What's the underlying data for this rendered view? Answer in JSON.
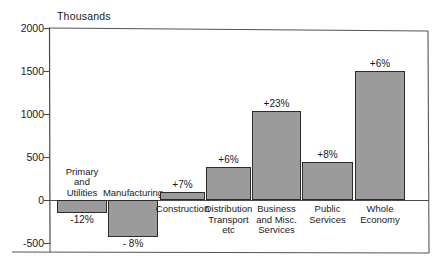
{
  "chart_data": {
    "type": "bar",
    "title": "",
    "unit_label": "Thousands",
    "xlabel": "",
    "ylabel": "Thousands",
    "ylim": [
      -500,
      2000
    ],
    "ytick_labels": [
      "2000",
      "1500",
      "1000",
      "500",
      "0",
      "-500"
    ],
    "ytick_values": [
      2000,
      1500,
      1000,
      500,
      0,
      -500
    ],
    "grid": false,
    "legend": "none",
    "zero_line": 0,
    "categories": [
      "Primary and Utilities",
      "Manufacturing",
      "Construction",
      "Distribution Transport etc",
      "Business and Misc. Services",
      "Public Services",
      "Whole Economy"
    ],
    "category_label_lines": [
      [
        "Primary",
        "and",
        "Utilities"
      ],
      [
        "Manufacturing"
      ],
      [
        "Construction"
      ],
      [
        "Distribution",
        "Transport",
        "etc"
      ],
      [
        "Business",
        "and Misc.",
        "Services"
      ],
      [
        "Public",
        "Services"
      ],
      [
        "Whole",
        "Economy"
      ]
    ],
    "values": [
      -150,
      -430,
      95,
      385,
      1035,
      440,
      1500
    ],
    "data_labels": [
      "-12%",
      "- 8%",
      "+7%",
      "+6%",
      "+23%",
      "+8%",
      "+6%"
    ],
    "series": [
      {
        "name": "Change in employment",
        "values": [
          -150,
          -430,
          95,
          385,
          1035,
          440,
          1500
        ]
      }
    ],
    "bar_color": "#9b9b9b",
    "bar_outline_color": "#2b2b2b",
    "axis_color": "#4a4a4a"
  },
  "caption": ""
}
